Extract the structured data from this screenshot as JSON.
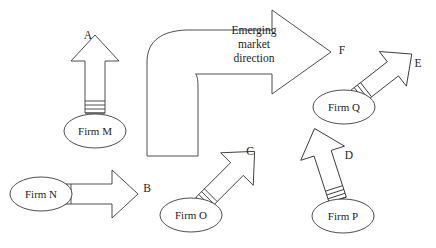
{
  "diagram": {
    "type": "flow-diagram",
    "background_color": "#ffffff",
    "stroke_color": "#3a3a3a",
    "text_color": "#1d1d1d",
    "big_arrow": {
      "caption_lines": [
        "Emerging",
        "market",
        "direction"
      ],
      "tip_label": "F",
      "shape": "curved-block-arrow",
      "direction": "up-then-right"
    },
    "firms": [
      {
        "id": "firm-m",
        "name": "Firm M",
        "arrow_label": "A",
        "arrow_direction": "up",
        "angle_deg": 0
      },
      {
        "id": "firm-n",
        "name": "Firm N",
        "arrow_label": "B",
        "arrow_direction": "right",
        "angle_deg": 90
      },
      {
        "id": "firm-o",
        "name": "Firm O",
        "arrow_label": "C",
        "arrow_direction": "up-right",
        "angle_deg": 45
      },
      {
        "id": "firm-p",
        "name": "Firm P",
        "arrow_label": "D",
        "arrow_direction": "up-slightly-left",
        "angle_deg": -18
      },
      {
        "id": "firm-q",
        "name": "Firm Q",
        "arrow_label": "E",
        "arrow_direction": "up-right",
        "angle_deg": 52
      }
    ]
  }
}
